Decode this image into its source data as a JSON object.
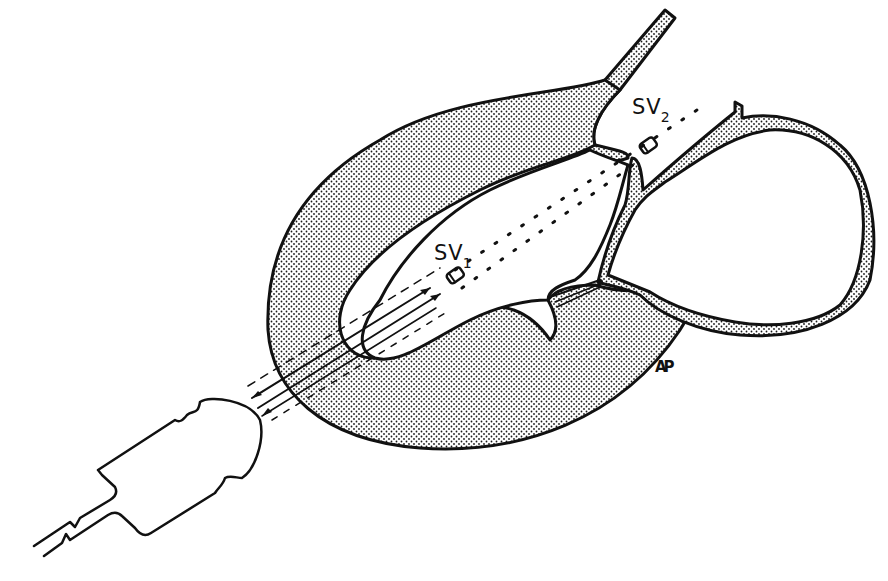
{
  "figure": {
    "colors": {
      "ink": "#111111",
      "stipple": "#1a1a1a",
      "background": "#ffffff"
    }
  },
  "labels": {
    "sv1": {
      "main": "SV",
      "sub": "1"
    },
    "sv2": {
      "main": "SV",
      "sub": "2"
    },
    "monogram": "AP"
  },
  "elements": [
    {
      "name": "transducer-probe",
      "shape": "bullet-shaped probe with cable"
    },
    {
      "name": "ultrasound-beam",
      "shape": "parallel lines with bidirectional arrows"
    },
    {
      "name": "sample-volume-1",
      "label": "SV1"
    },
    {
      "name": "sample-volume-2",
      "label": "SV2"
    },
    {
      "name": "heart-wall",
      "shape": "stippled myocardium"
    },
    {
      "name": "great-vessels",
      "shape": "stippled tubes"
    }
  ]
}
